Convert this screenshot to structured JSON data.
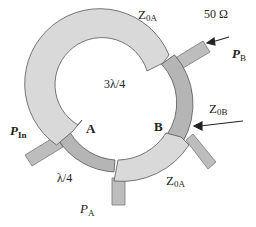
{
  "diagram": {
    "colors": {
      "light_segment": "#d9d9d9",
      "dark_segment": "#b5b5b5",
      "stub": "#bdbdbd",
      "outline": "#555555",
      "text": "#222222"
    },
    "labels": {
      "z0a_top": "Z",
      "z0a_top_sub": "0A",
      "ohm": "50 Ω",
      "pb": "P",
      "pb_sub": "B",
      "three_lambda_4": "3λ/4",
      "z0b": "Z",
      "z0b_sub": "0B",
      "pin": "P",
      "pin_sub": "In",
      "node_a": "A",
      "node_b": "B",
      "lambda_4": "λ/4",
      "z0a_bottom": "Z",
      "z0a_bottom_sub": "0A",
      "pa": "P",
      "pa_sub": "A"
    }
  }
}
